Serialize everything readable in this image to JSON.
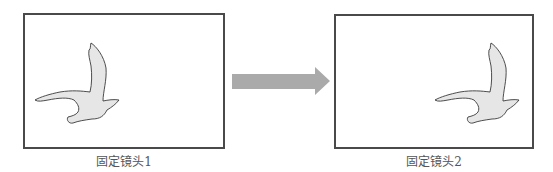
{
  "panels": [
    {
      "id": "shot-1",
      "caption": "固定镜头1",
      "subject": "bird-silhouette",
      "subject_position": "left-center"
    },
    {
      "id": "shot-2",
      "caption": "固定镜头2",
      "subject": "bird-silhouette",
      "subject_position": "right-center"
    }
  ],
  "arrow": {
    "direction": "right",
    "color": "#aaaaaa"
  },
  "colors": {
    "frame": "#4a4a4a",
    "bird_fill": "#e6e6e6",
    "bird_stroke": "#3a3a3a",
    "caption": "#555555"
  }
}
